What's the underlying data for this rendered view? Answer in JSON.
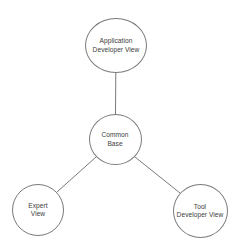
{
  "diagram": {
    "type": "hub-and-spoke",
    "background_color": "#ffffff",
    "stroke_color": "#7a7a7a",
    "text_color": "#3c3c3c",
    "nodes": [
      {
        "id": "application-developer-view",
        "label_line1": "Application",
        "label_line2": "Developer View",
        "cx": 116,
        "cy": 45.5,
        "rx": 31,
        "ry": 27.5
      },
      {
        "id": "common-base",
        "label_line1": "Common",
        "label_line2": "Base",
        "cx": 115,
        "cy": 139.5,
        "rx": 26.5,
        "ry": 25.5
      },
      {
        "id": "expert-view",
        "label_line1": "Expert",
        "label_line2": "View",
        "cx": 38,
        "cy": 210,
        "rx": 26,
        "ry": 26
      },
      {
        "id": "tool-developer-view",
        "label_line1": "Tool",
        "label_line2": "Developer View",
        "cx": 200,
        "cy": 211,
        "rx": 27.5,
        "ry": 27
      }
    ],
    "edges": [
      {
        "id": "edge-common-base-to-application-developer-view",
        "from": "common-base",
        "to": "application-developer-view",
        "x1": 115.5,
        "y1": 114,
        "x2": 115.8,
        "y2": 73
      },
      {
        "id": "edge-common-base-to-expert-view",
        "from": "common-base",
        "to": "expert-view",
        "x1": 96,
        "y1": 157,
        "x2": 57,
        "y2": 192
      },
      {
        "id": "edge-common-base-to-tool-developer-view",
        "from": "common-base",
        "to": "tool-developer-view",
        "x1": 135,
        "y1": 157,
        "x2": 180,
        "y2": 193
      }
    ]
  }
}
